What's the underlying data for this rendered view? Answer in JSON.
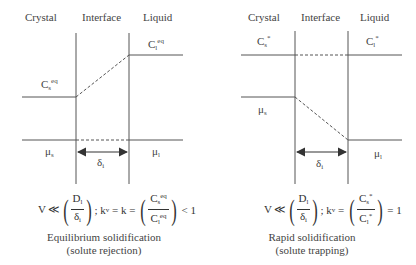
{
  "left_panel": {
    "headers": {
      "crystal": "Crystal",
      "interface": "Interface",
      "liquid": "Liquid"
    },
    "labels": {
      "cs": {
        "base": "C",
        "sub": "s",
        "sup": "eq"
      },
      "cl": {
        "base": "C",
        "sub": "l",
        "sup": "eq"
      },
      "mu_s": {
        "base": "μ",
        "sub": "s"
      },
      "mu_l": {
        "base": "μ",
        "sub": "l"
      },
      "delta": {
        "base": "δ",
        "sub": "i"
      }
    },
    "equation": {
      "lhs": "V ≪",
      "frac1_num": "D",
      "frac1_num_sub": "l",
      "frac1_den": "δ",
      "frac1_den_sub": "i",
      "sep": "; k",
      "kv_sub": "v",
      "mid": " = k = ",
      "frac2_num": "C",
      "frac2_num_sub": "s",
      "frac2_num_sup": "eq",
      "frac2_den": "C",
      "frac2_den_sub": "l",
      "frac2_den_sup": "eq",
      "rhs": " < 1"
    },
    "caption_line1": "Equilibrium solidification",
    "caption_line2": "(solute rejection)"
  },
  "right_panel": {
    "headers": {
      "crystal": "Crystal",
      "interface": "Interface",
      "liquid": "Liquid"
    },
    "labels": {
      "cs": {
        "base": "C",
        "sub": "s",
        "sup": "*"
      },
      "cl": {
        "base": "C",
        "sub": "l",
        "sup": "*"
      },
      "mu_s": {
        "base": "μ",
        "sub": "s"
      },
      "mu_l": {
        "base": "μ",
        "sub": "l"
      },
      "delta": {
        "base": "δ",
        "sub": "i"
      }
    },
    "equation": {
      "lhs": "V ≪",
      "frac1_num": "D",
      "frac1_num_sub": "l",
      "frac1_den": "δ",
      "frac1_den_sub": "i",
      "sep": "; k",
      "kv_sub": "v",
      "mid": " = ",
      "frac2_num": "C",
      "frac2_num_sub": "s",
      "frac2_num_sup": "*",
      "frac2_den": "C",
      "frac2_den_sub": "l",
      "frac2_den_sup": "*",
      "rhs": " = 1"
    },
    "caption_line1": "Rapid solidification",
    "caption_line2": "(solute trapping)"
  },
  "colors": {
    "line": "#555555",
    "text": "#444444"
  }
}
